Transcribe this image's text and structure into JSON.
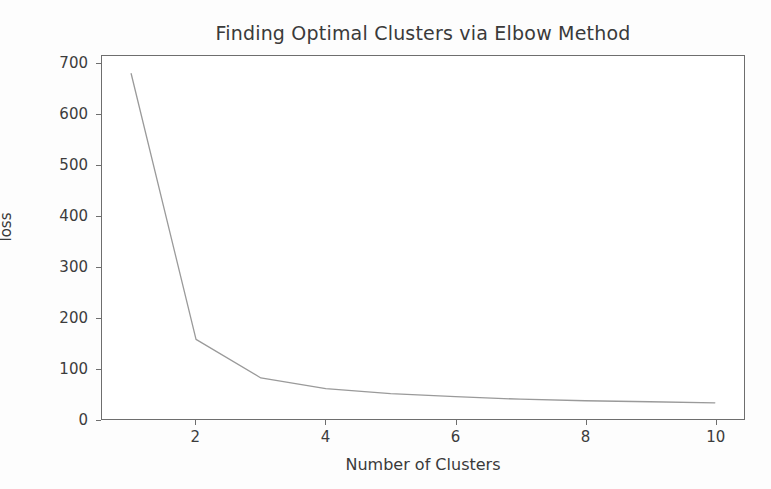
{
  "chart_data": {
    "type": "line",
    "title": "Finding Optimal Clusters via Elbow Method",
    "xlabel": "Number of Clusters",
    "ylabel": "loss",
    "x": [
      1,
      2,
      3,
      4,
      5,
      6,
      7,
      8,
      9,
      10
    ],
    "values": [
      681,
      157,
      81,
      60,
      50,
      44,
      39,
      36,
      34,
      32
    ],
    "series": [
      {
        "name": "loss",
        "values": [
          681,
          157,
          81,
          60,
          50,
          44,
          39,
          36,
          34,
          32
        ]
      }
    ],
    "xlim": [
      0.55,
      10.45
    ],
    "ylim": [
      0,
      716
    ],
    "xticks": [
      2,
      4,
      6,
      8,
      10
    ],
    "xtick_labels": [
      "2",
      "4",
      "6",
      "8",
      "10"
    ],
    "yticks": [
      0,
      100,
      200,
      300,
      400,
      500,
      600,
      700
    ],
    "ytick_labels": [
      "0",
      "100",
      "200",
      "300",
      "400",
      "500",
      "600",
      "700"
    ],
    "grid": false,
    "legend": false,
    "legend_position": "none",
    "line_color": "#9a9a9a",
    "line_width": 1.3,
    "marker": "none",
    "frame_color": "#6e6e6e",
    "background_color": "#ffffff"
  }
}
